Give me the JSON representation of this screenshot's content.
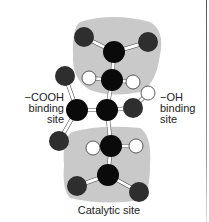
{
  "diagram": {
    "labels": {
      "cooh_binding": [
        "−COOH",
        "binding",
        "site"
      ],
      "oh_binding": [
        "−OH",
        "binding",
        "site"
      ],
      "catalytic": "Catalytic site"
    },
    "colors": {
      "region": "#c8c8c8",
      "atom_black": "#0a0a0a",
      "atom_dark": "#2e2e2e",
      "atom_white": "#ffffff",
      "bond": "#ffffff",
      "text": "#222222"
    }
  }
}
